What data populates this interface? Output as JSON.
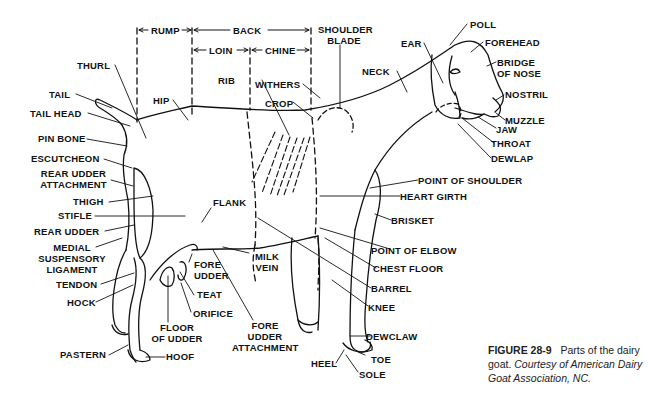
{
  "figure": {
    "number": "FIGURE 28-9",
    "title": "Parts of the dairy goat.",
    "credit": "Courtesy of American Dairy Goat Association, NC."
  },
  "regions": {
    "rump": "RUMP",
    "back": "BACK",
    "loin": "LOIN",
    "chine": "CHINE",
    "shoulder_blade_1": "SHOULDER",
    "shoulder_blade_2": "BLADE"
  },
  "labels": {
    "thurl": "THURL",
    "tail": "TAIL",
    "tail_head": "TAIL HEAD",
    "pin_bone": "PIN BONE",
    "escutcheon": "ESCUTCHEON",
    "rear_udder_attachment_1": "REAR UDDER",
    "rear_udder_attachment_2": "ATTACHMENT",
    "thigh": "THIGH",
    "stifle": "STIFLE",
    "rear_udder": "REAR UDDER",
    "medial_1": "MEDIAL",
    "medial_2": "SUSPENSORY",
    "medial_3": "LIGAMENT",
    "tendon": "TENDON",
    "hock": "HOCK",
    "pastern": "PASTERN",
    "hoof": "HOOF",
    "hip": "HIP",
    "rib": "RIB",
    "withers": "WITHERS",
    "crop": "CROP",
    "neck": "NECK",
    "ear": "EAR",
    "poll": "POLL",
    "forehead": "FOREHEAD",
    "bridge_1": "BRIDGE",
    "bridge_2": "OF NOSE",
    "nostril": "NOSTRIL",
    "muzzle": "MUZZLE",
    "jaw": "JAW",
    "throat": "THROAT",
    "dewlap": "DEWLAP",
    "point_of_shoulder": "POINT OF SHOULDER",
    "heart_girth": "HEART GIRTH",
    "brisket": "BRISKET",
    "point_of_elbow": "POINT OF ELBOW",
    "chest_floor": "CHEST FLOOR",
    "barrel": "BARREL",
    "knee": "KNEE",
    "dewclaw": "DEWCLAW",
    "toe": "TOE",
    "sole": "SOLE",
    "heel": "HEEL",
    "flank": "FLANK",
    "milk_1": "MILK",
    "milk_2": "VEIN",
    "fore_udder_1": "FORE",
    "fore_udder_2": "UDDER",
    "teat": "TEAT",
    "orifice": "ORIFICE",
    "floor_1": "FLOOR",
    "floor_2": "OF UDDER",
    "fua_1": "FORE",
    "fua_2": "UDDER",
    "fua_3": "ATTACHMENT"
  },
  "colors": {
    "ink": "#111111",
    "background": "#ffffff"
  }
}
